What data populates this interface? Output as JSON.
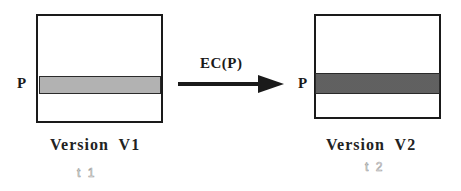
{
  "diagram": {
    "version1": {
      "label": "Version  V1",
      "time": "t 1",
      "row_label": "P"
    },
    "version2": {
      "label": "Version  V2",
      "time": "t 2",
      "row_label": "P"
    },
    "transition": {
      "label": "EC(P)",
      "direction": "V1 -> V2"
    },
    "colors": {
      "border": "#1a1a1a",
      "band_v1": "#d4d4d4",
      "band_v2": "#b8b8b8",
      "time_label": "#9a9a9a"
    }
  }
}
